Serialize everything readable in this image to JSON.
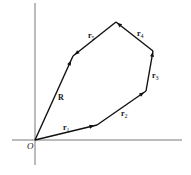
{
  "diagram": {
    "colors": {
      "axis": "#555555",
      "vector": "#111111",
      "background": "#ffffff"
    },
    "origin": {
      "label": "O",
      "x": 35,
      "y": 140
    },
    "axes": {
      "x_axis": {
        "x1": 12,
        "y1": 140,
        "x2": 182,
        "y2": 140
      },
      "y_axis": {
        "x1": 35,
        "y1": 3,
        "x2": 35,
        "y2": 165
      }
    },
    "vectors": [
      {
        "name": "r1",
        "label": "r",
        "sub": "1",
        "from": [
          35,
          140
        ],
        "to": [
          97,
          125
        ],
        "label_pos": [
          63,
          130
        ]
      },
      {
        "name": "r2",
        "label": "r",
        "sub": "2",
        "from": [
          97,
          125
        ],
        "to": [
          146,
          91
        ],
        "label_pos": [
          121,
          116
        ]
      },
      {
        "name": "r3",
        "label": "r",
        "sub": "3",
        "from": [
          146,
          91
        ],
        "to": [
          153,
          51
        ],
        "label_pos": [
          152,
          78
        ]
      },
      {
        "name": "r4",
        "label": "r",
        "sub": "4",
        "from": [
          153,
          51
        ],
        "to": [
          116,
          22
        ],
        "label_pos": [
          137,
          36
        ]
      },
      {
        "name": "r5",
        "label": "r",
        "sub": "5",
        "from": [
          116,
          22
        ],
        "to": [
          73,
          56
        ],
        "label_pos": [
          88,
          38
        ]
      }
    ],
    "resultant": {
      "name": "R",
      "label": "R",
      "from": [
        35,
        140
      ],
      "to": [
        73,
        56
      ],
      "label_pos": [
        58,
        100
      ]
    }
  }
}
